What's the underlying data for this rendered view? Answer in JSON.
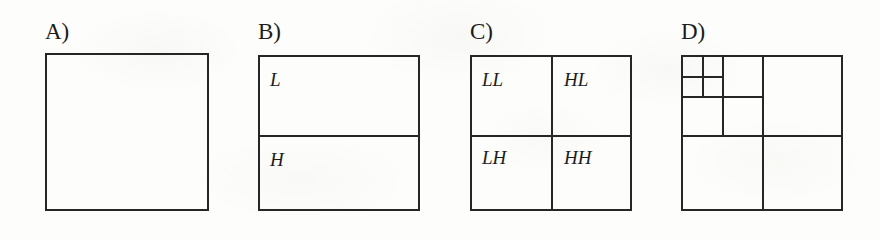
{
  "figure": {
    "background_color": "#fdfdfb",
    "line_color": "#262626",
    "text_color": "#1c1c1c",
    "panels": [
      {
        "id": "a",
        "label": "A)",
        "label_x": 45,
        "label_y": 20,
        "box": {
          "x": 45,
          "y": 53,
          "w": 164,
          "h": 158
        },
        "subdivision": "none",
        "bands": []
      },
      {
        "id": "b",
        "label": "B)",
        "label_x": 258,
        "label_y": 20,
        "box": {
          "x": 258,
          "y": 55,
          "w": 162,
          "h": 156
        },
        "subdivision": "horizontal-split",
        "bands": [
          {
            "name": "L",
            "x": 270,
            "y": 70
          },
          {
            "name": "H",
            "x": 270,
            "y": 150
          }
        ]
      },
      {
        "id": "c",
        "label": "C)",
        "label_x": 470,
        "label_y": 20,
        "box": {
          "x": 470,
          "y": 55,
          "w": 162,
          "h": 156
        },
        "subdivision": "quad-split",
        "bands": [
          {
            "name": "LL",
            "x": 482,
            "y": 70
          },
          {
            "name": "HL",
            "x": 564,
            "y": 70
          },
          {
            "name": "LH",
            "x": 482,
            "y": 148
          },
          {
            "name": "HH",
            "x": 564,
            "y": 148
          }
        ]
      },
      {
        "id": "d",
        "label": "D)",
        "label_x": 681,
        "label_y": 20,
        "box": {
          "x": 681,
          "y": 55,
          "w": 162,
          "h": 156
        },
        "subdivision": "recursive-quad-split-3-levels",
        "levels": 3,
        "bands": []
      }
    ]
  }
}
